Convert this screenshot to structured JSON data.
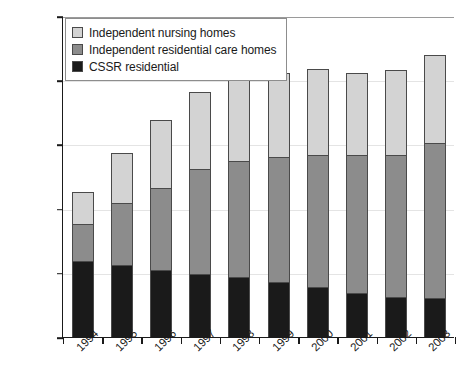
{
  "chart_data": {
    "type": "bar",
    "subtype": "stacked-vertical",
    "title": "",
    "xlabel": "",
    "ylabel": "",
    "ylim": [
      0,
      250000
    ],
    "ytick_step": 50000,
    "ytick_labels": [
      "0",
      "50,000",
      "100,000",
      "150,000",
      "200,000",
      "250,000"
    ],
    "ytick_values": [
      0,
      50000,
      100000,
      150000,
      200000,
      250000
    ],
    "grid": true,
    "grid_axis": "y",
    "legend_position": "top-left",
    "categories": [
      "1994",
      "1995",
      "1996",
      "1997",
      "1998",
      "1999",
      "2000",
      "2001",
      "2002",
      "2003"
    ],
    "stack_order_bottom_to_top": [
      "CSSR residential",
      "Independent residential care homes",
      "Independent nursing homes"
    ],
    "series": [
      {
        "name": "CSSR residential",
        "color": "#1a1a1a",
        "values": [
          59000,
          56000,
          52000,
          49000,
          47000,
          43000,
          39000,
          34000,
          31000,
          30000
        ]
      },
      {
        "name": "Independent residential care homes",
        "color": "#8c8c8c",
        "values": [
          29000,
          48000,
          64000,
          82000,
          90000,
          97000,
          103000,
          108000,
          111000,
          121000
        ]
      },
      {
        "name": "Independent nursing homes",
        "color": "#d3d3d3",
        "values": [
          25000,
          39000,
          53000,
          60000,
          67000,
          66000,
          67000,
          64000,
          66000,
          69000
        ]
      }
    ],
    "totals": [
      113000,
      143000,
      169000,
      191000,
      204000,
      206000,
      209000,
      206000,
      208000,
      220000
    ]
  },
  "legend": {
    "entries": [
      {
        "label": "Independent nursing homes",
        "color": "#d3d3d3"
      },
      {
        "label": "Independent residential care homes",
        "color": "#8c8c8c"
      },
      {
        "label": "CSSR residential",
        "color": "#1a1a1a"
      }
    ]
  },
  "colors": {
    "axis": "#1a1a1a",
    "grid": "#e4e4e4",
    "top_rule": "#9a9a9a",
    "segment_border": "#4a4a4a",
    "background": "#ffffff"
  }
}
